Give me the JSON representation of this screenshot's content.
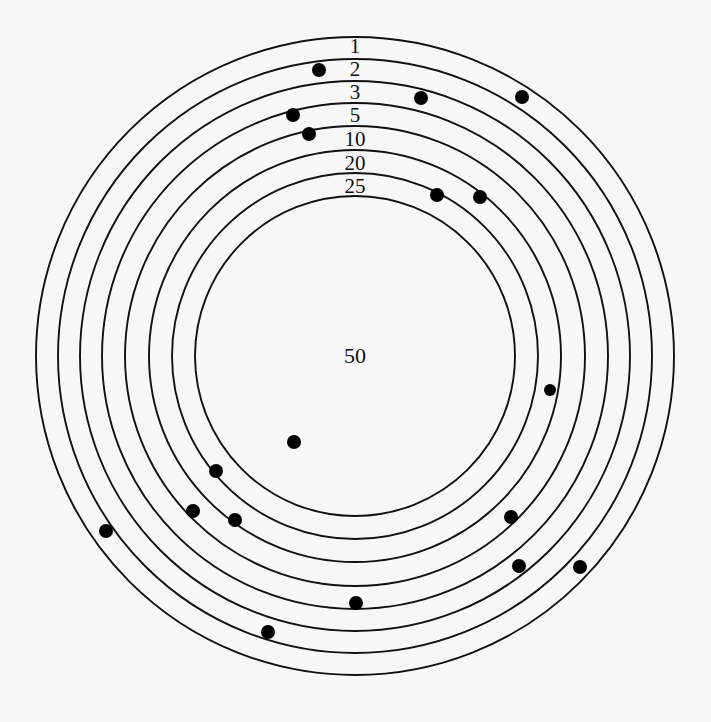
{
  "figure": {
    "type": "concentric-ring-scatter",
    "background_color": "#f7f7f7",
    "stroke_color": "#111111",
    "dot_color": "#000000",
    "center": {
      "x": 355,
      "y": 356
    }
  },
  "chart_data": {
    "type": "scatter",
    "title": "",
    "subtitle": "",
    "xlabel": "",
    "ylabel": "",
    "grid": true,
    "legend": "none",
    "ring_labels": [
      "1",
      "2",
      "3",
      "5",
      "10",
      "20",
      "25",
      "50"
    ],
    "rings": [
      {
        "label": "1",
        "radius_px": 319,
        "label_x": 355,
        "label_y": 46
      },
      {
        "label": "2",
        "radius_px": 297,
        "label_x": 355,
        "label_y": 69
      },
      {
        "label": "3",
        "radius_px": 275,
        "label_x": 355,
        "label_y": 92
      },
      {
        "label": "5",
        "radius_px": 253,
        "label_x": 355,
        "label_y": 115
      },
      {
        "label": "10",
        "radius_px": 230,
        "label_x": 355,
        "label_y": 139
      },
      {
        "label": "20",
        "radius_px": 206,
        "label_x": 355,
        "label_y": 163
      },
      {
        "label": "25",
        "radius_px": 183,
        "label_x": 355,
        "label_y": 186
      },
      {
        "label": "50",
        "radius_px": 160,
        "label_x": 355,
        "label_y": 356
      }
    ],
    "points": [
      {
        "x": 319,
        "y": 70,
        "r": 7
      },
      {
        "x": 421,
        "y": 98,
        "r": 7
      },
      {
        "x": 522,
        "y": 97,
        "r": 7
      },
      {
        "x": 293,
        "y": 115,
        "r": 7
      },
      {
        "x": 309,
        "y": 134,
        "r": 7
      },
      {
        "x": 437,
        "y": 195,
        "r": 7
      },
      {
        "x": 480,
        "y": 197,
        "r": 7
      },
      {
        "x": 550,
        "y": 390,
        "r": 6
      },
      {
        "x": 294,
        "y": 442,
        "r": 7
      },
      {
        "x": 216,
        "y": 471,
        "r": 7
      },
      {
        "x": 193,
        "y": 511,
        "r": 7
      },
      {
        "x": 235,
        "y": 520,
        "r": 7
      },
      {
        "x": 511,
        "y": 517,
        "r": 7
      },
      {
        "x": 106,
        "y": 531,
        "r": 7
      },
      {
        "x": 519,
        "y": 566,
        "r": 7
      },
      {
        "x": 580,
        "y": 567,
        "r": 7
      },
      {
        "x": 356,
        "y": 603,
        "r": 7
      },
      {
        "x": 268,
        "y": 632,
        "r": 7
      }
    ]
  }
}
